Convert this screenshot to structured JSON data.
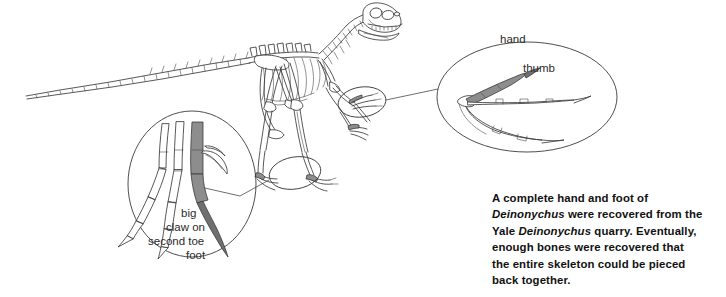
{
  "figure": {
    "kind": "scientific-illustration",
    "background_color": "#ffffff",
    "line_color": "#3a3a3a",
    "shade_color": "#8d8d8d",
    "text_color": "#111111"
  },
  "labels": {
    "hand": "hand",
    "thumb": "thumb",
    "foot": "foot",
    "claw_line1": "big",
    "claw_line2": "claw on",
    "claw_line3": "second toe"
  },
  "caption": {
    "line1_a": "A complete hand and foot of",
    "line2_genus": "Deinonychus",
    "line2_b": " were recovered from the",
    "line3_a": "Yale ",
    "line3_genus": "Deinonychus",
    "line3_b": " quarry. Eventually,",
    "line4": "enough bones were recovered that",
    "line5": "the entire skeleton could be pieced",
    "line6": "back together."
  }
}
